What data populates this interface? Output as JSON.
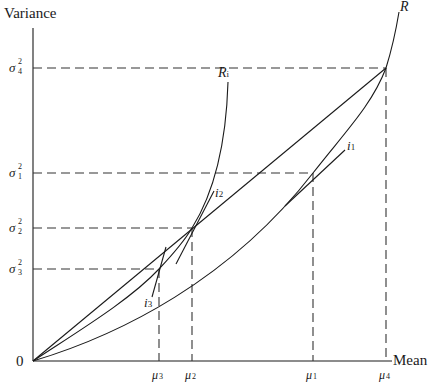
{
  "diagram": {
    "axes": {
      "y_label": "Variance",
      "x_label": "Mean",
      "origin_label": "0"
    },
    "y_ticks": [
      {
        "symbol": "σ",
        "sup": "2",
        "sub": "4"
      },
      {
        "symbol": "σ",
        "sup": "2",
        "sub": "1"
      },
      {
        "symbol": "σ",
        "sup": "2",
        "sub": "2"
      },
      {
        "symbol": "σ",
        "sup": "2",
        "sub": "3"
      }
    ],
    "x_ticks": [
      {
        "symbol": "μ",
        "sub": "3"
      },
      {
        "symbol": "μ",
        "sub": "2"
      },
      {
        "symbol": "μ",
        "sub": "1"
      },
      {
        "symbol": "μ",
        "sub": "4"
      }
    ],
    "curves": {
      "R": {
        "symbol": "R",
        "sub": ""
      },
      "Ri": {
        "symbol": "R",
        "sub": "i"
      }
    },
    "tangents": [
      {
        "symbol": "i",
        "sub": "1"
      },
      {
        "symbol": "i",
        "sub": "2"
      },
      {
        "symbol": "i",
        "sub": "3"
      }
    ],
    "colors": {
      "line": "#1a1a1a",
      "background": "#ffffff"
    }
  }
}
